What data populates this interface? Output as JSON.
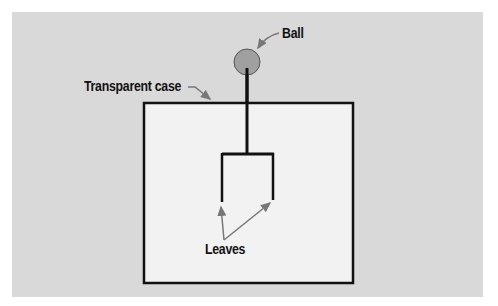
{
  "diagram": {
    "type": "electroscope",
    "labels": {
      "ball": "Ball",
      "case": "Transparent case",
      "leaves": "Leaves"
    },
    "colors": {
      "background": "#d9d9d9",
      "case_fill": "#f2f2f2",
      "stroke": "#111111",
      "ball_fill": "#a0a0a0",
      "arrow": "#777777"
    }
  }
}
